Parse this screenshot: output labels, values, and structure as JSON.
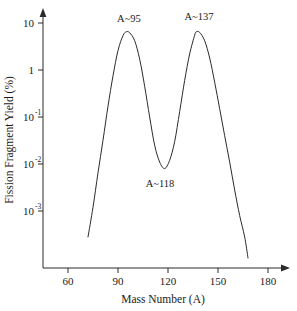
{
  "chart_data": {
    "type": "line",
    "title": "",
    "xlabel": "Mass Number (A)",
    "ylabel": "Fission Fragment Yield (%)",
    "yscale": "log",
    "xscale": "linear",
    "xlim": [
      48,
      192
    ],
    "ylim": [
      0.0002,
      20
    ],
    "grid": false,
    "legend": null,
    "xticks": [
      60,
      90,
      120,
      150,
      180
    ],
    "xtick_labels": [
      "60",
      "90",
      "120",
      "150",
      "180"
    ],
    "yticks": [
      10,
      1,
      0.1,
      0.01,
      0.001
    ],
    "ytick_labels": [
      "10",
      "1",
      "10-1",
      "10-2",
      "10-3"
    ],
    "ytick_mantissas": [
      "10",
      "1",
      "10",
      "10",
      "10"
    ],
    "ytick_exponents": [
      "",
      "",
      "-1",
      "-2",
      "-3"
    ],
    "annotations": [
      {
        "text": "A~95",
        "x": 95,
        "y": 6.5,
        "note": "light-fragment peak"
      },
      {
        "text": "A~118",
        "x": 118,
        "y": 0.008,
        "note": "symmetric-fission valley"
      },
      {
        "text": "A~137",
        "x": 137,
        "y": 6.5,
        "note": "heavy-fragment peak"
      }
    ],
    "series": [
      {
        "name": "Fission Fragment Yield",
        "x": [
          72,
          75,
          78,
          81,
          84,
          87,
          90,
          93,
          95,
          97,
          100,
          103,
          106,
          109,
          112,
          115,
          118,
          121,
          124,
          127,
          130,
          133,
          136,
          137,
          139,
          142,
          145,
          148,
          151,
          154,
          157,
          160,
          163,
          166,
          168
        ],
        "y": [
          0.00028,
          0.0012,
          0.0065,
          0.032,
          0.17,
          0.75,
          2.6,
          5.4,
          6.5,
          6.2,
          4.2,
          1.7,
          0.45,
          0.1,
          0.025,
          0.011,
          0.008,
          0.012,
          0.03,
          0.13,
          0.6,
          2.2,
          5.5,
          6.5,
          6.3,
          4.2,
          1.8,
          0.55,
          0.15,
          0.04,
          0.011,
          0.0028,
          0.0008,
          0.00028,
          0.0001
        ]
      }
    ]
  },
  "axes": {
    "x_arrow": "arrow-right",
    "y_arrow": "arrow-up"
  }
}
